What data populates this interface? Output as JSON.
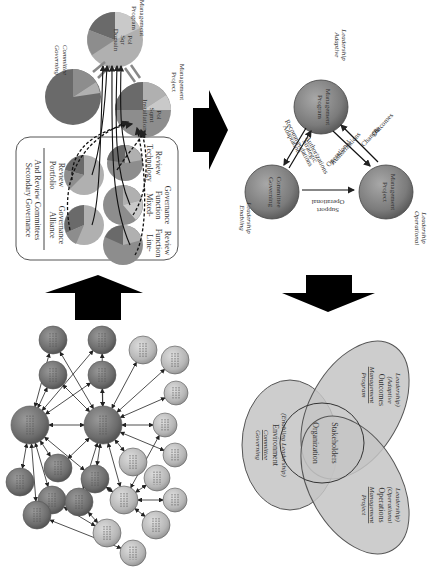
{
  "figure": {
    "orientation": "rotated-90-clockwise",
    "colors": {
      "dark_sphere": "#6f6f6f",
      "light_sphere": "#b9b9b9",
      "pie_dark": "#6a6a6a",
      "pie_mid": "#8d8d8d",
      "pie_light": "#b0b0b0",
      "pie_lighter": "#c9c9c9",
      "venn_fill": "#c4c4c4",
      "arrow_fill": "#000000",
      "line": "#222222"
    }
  },
  "panel_governance": {
    "program_management": {
      "label_line1": "Program",
      "label_line2": "Management",
      "inner_line1": "Domain",
      "inner_line2": "Sqr",
      "inner_line3": "Pol"
    },
    "governing_committee": {
      "label_line1": "Governing",
      "label_line2": "Committee"
    },
    "project_management": {
      "label_line1": "Project",
      "label_line2": "Management",
      "inner_line1": "Installation",
      "inner_line2": "Sqmt",
      "inner_line3": "Pol"
    },
    "secondary_box": {
      "title_line1": "Secondary Governance",
      "title_line2": "And Review Committees",
      "committees": [
        {
          "line1": "Alliance",
          "line2": "Governance",
          "line3": ""
        },
        {
          "line1": "Portfolio",
          "line2": "Review",
          "line3": ""
        },
        {
          "line1": "Line-",
          "line2": "Function",
          "line3": "Review"
        },
        {
          "line1": "Mixed-",
          "line2": "Function",
          "line3": "Governance"
        },
        {
          "line1": "Technology",
          "line2": "Review",
          "line3": ""
        }
      ]
    }
  },
  "panel_triangle": {
    "program_management": {
      "line1": "Program",
      "line2": "Management",
      "leadership_line1": "Adaptive",
      "leadership_line2": "Leadership"
    },
    "governing_committee": {
      "line1": "Governing",
      "line2": "Committee",
      "leadership_line1": "Enabling",
      "leadership_line2": "Leadership"
    },
    "project_management": {
      "line1": "Project",
      "line2": "Management",
      "leadership_line1": "Operational",
      "leadership_line2": "Leadership"
    },
    "edges": {
      "gc_to_pgm_upper_line1": "Adaptation",
      "gc_to_pgm_upper_line2": "Recommendations",
      "gc_to_pgm_lower_line1": "Strategic",
      "gc_to_pgm_lower_line2": "Authorizations",
      "pgm_to_pm_upper_line1": "Operational",
      "pgm_to_pm_upper_line2": "Authorizations",
      "pm_to_pgm_line1": "Changes",
      "pm_to_pgm_line2": "&",
      "pm_to_pgm_line3": "Outcomes",
      "gc_to_pm_line1": "Operational",
      "gc_to_pm_line2": "Support"
    }
  },
  "panel_venn": {
    "governing": {
      "line1": "Governing",
      "line2": "Committee",
      "line3": "Environment",
      "line4": "(Enabling Leadership)"
    },
    "program": {
      "line1": "Program",
      "line2": "Management",
      "line3": "Outcomes",
      "line4": "(Adaptive",
      "line5": "Leadership)"
    },
    "project": {
      "line1": "Project",
      "line2": "Management",
      "line3": "Operations",
      "line4": "(Operational",
      "line5": "Leadership)"
    },
    "center": {
      "line1": "Organization",
      "line2": "Stakeholders"
    }
  },
  "panel_network": {
    "node_text": "· · ·"
  }
}
